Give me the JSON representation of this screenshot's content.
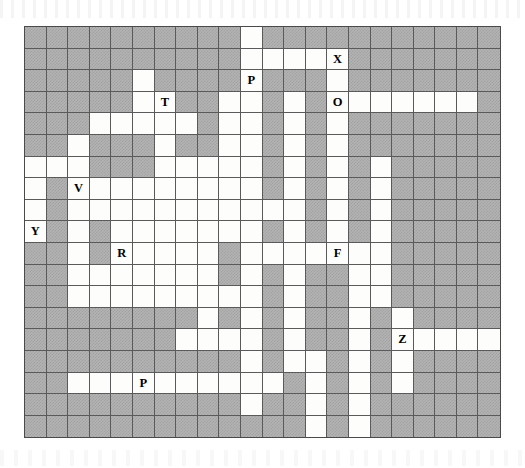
{
  "puzzle": {
    "type": "word-search-grid",
    "title": "",
    "columns": 22,
    "rows": 19,
    "cell_size_px": 21.6,
    "origin_px": {
      "x": 24,
      "y": 26
    },
    "colors": {
      "blocked_cell": "#b3b3b3",
      "open_cell": "#fdfdfb",
      "grid_line": "#5a5a5a",
      "border": "#4a4a4a",
      "letter": "#000000",
      "page_background": "#ffffff"
    },
    "legend": {
      "blocked": "shaded hatched square",
      "open": "white fillable square"
    },
    "letters": [
      {
        "row": 1,
        "col": 14,
        "char": "X"
      },
      {
        "row": 2,
        "col": 10,
        "char": "P"
      },
      {
        "row": 3,
        "col": 6,
        "char": "T"
      },
      {
        "row": 3,
        "col": 14,
        "char": "O"
      },
      {
        "row": 7,
        "col": 2,
        "char": "V"
      },
      {
        "row": 9,
        "col": 0,
        "char": "Y"
      },
      {
        "row": 10,
        "col": 4,
        "char": "R"
      },
      {
        "row": 10,
        "col": 14,
        "char": "F"
      },
      {
        "row": 14,
        "col": 17,
        "char": "Z"
      },
      {
        "row": 16,
        "col": 5,
        "char": "P"
      }
    ],
    "letters_flat": "X P T O V Y R F Z P",
    "open_cells": [
      [
        0,
        10
      ],
      [
        1,
        10
      ],
      [
        1,
        11
      ],
      [
        1,
        12
      ],
      [
        1,
        13
      ],
      [
        1,
        14
      ],
      [
        2,
        5
      ],
      [
        2,
        10
      ],
      [
        2,
        14
      ],
      [
        3,
        5
      ],
      [
        3,
        6
      ],
      [
        3,
        9
      ],
      [
        3,
        10
      ],
      [
        3,
        12
      ],
      [
        3,
        14
      ],
      [
        3,
        15
      ],
      [
        3,
        16
      ],
      [
        3,
        17
      ],
      [
        3,
        18
      ],
      [
        3,
        19
      ],
      [
        3,
        20
      ],
      [
        4,
        3
      ],
      [
        4,
        4
      ],
      [
        4,
        5
      ],
      [
        4,
        6
      ],
      [
        4,
        7
      ],
      [
        4,
        9
      ],
      [
        4,
        10
      ],
      [
        4,
        12
      ],
      [
        4,
        14
      ],
      [
        5,
        2
      ],
      [
        5,
        6
      ],
      [
        5,
        9
      ],
      [
        5,
        10
      ],
      [
        5,
        12
      ],
      [
        5,
        14
      ],
      [
        6,
        0
      ],
      [
        6,
        1
      ],
      [
        6,
        2
      ],
      [
        6,
        6
      ],
      [
        6,
        7
      ],
      [
        6,
        8
      ],
      [
        6,
        9
      ],
      [
        6,
        10
      ],
      [
        6,
        12
      ],
      [
        6,
        14
      ],
      [
        6,
        16
      ],
      [
        7,
        0
      ],
      [
        7,
        2
      ],
      [
        7,
        3
      ],
      [
        7,
        4
      ],
      [
        7,
        5
      ],
      [
        7,
        6
      ],
      [
        7,
        7
      ],
      [
        7,
        8
      ],
      [
        7,
        9
      ],
      [
        7,
        10
      ],
      [
        7,
        12
      ],
      [
        7,
        14
      ],
      [
        7,
        16
      ],
      [
        8,
        0
      ],
      [
        8,
        2
      ],
      [
        8,
        3
      ],
      [
        8,
        4
      ],
      [
        8,
        5
      ],
      [
        8,
        6
      ],
      [
        8,
        7
      ],
      [
        8,
        8
      ],
      [
        8,
        9
      ],
      [
        8,
        10
      ],
      [
        8,
        11
      ],
      [
        8,
        12
      ],
      [
        8,
        14
      ],
      [
        8,
        16
      ],
      [
        9,
        0
      ],
      [
        9,
        2
      ],
      [
        9,
        4
      ],
      [
        9,
        5
      ],
      [
        9,
        6
      ],
      [
        9,
        7
      ],
      [
        9,
        8
      ],
      [
        9,
        9
      ],
      [
        9,
        10
      ],
      [
        9,
        12
      ],
      [
        9,
        14
      ],
      [
        9,
        16
      ],
      [
        10,
        2
      ],
      [
        10,
        4
      ],
      [
        10,
        5
      ],
      [
        10,
        6
      ],
      [
        10,
        7
      ],
      [
        10,
        8
      ],
      [
        10,
        10
      ],
      [
        10,
        11
      ],
      [
        10,
        12
      ],
      [
        10,
        13
      ],
      [
        10,
        14
      ],
      [
        10,
        15
      ],
      [
        10,
        16
      ],
      [
        11,
        2
      ],
      [
        11,
        3
      ],
      [
        11,
        4
      ],
      [
        11,
        5
      ],
      [
        11,
        6
      ],
      [
        11,
        7
      ],
      [
        11,
        8
      ],
      [
        11,
        10
      ],
      [
        11,
        12
      ],
      [
        11,
        15
      ],
      [
        11,
        16
      ],
      [
        12,
        2
      ],
      [
        12,
        3
      ],
      [
        12,
        4
      ],
      [
        12,
        5
      ],
      [
        12,
        6
      ],
      [
        12,
        7
      ],
      [
        12,
        8
      ],
      [
        12,
        9
      ],
      [
        12,
        10
      ],
      [
        12,
        12
      ],
      [
        12,
        15
      ],
      [
        12,
        16
      ],
      [
        13,
        8
      ],
      [
        13,
        10
      ],
      [
        13,
        12
      ],
      [
        13,
        15
      ],
      [
        13,
        17
      ],
      [
        14,
        7
      ],
      [
        14,
        8
      ],
      [
        14,
        9
      ],
      [
        14,
        10
      ],
      [
        14,
        12
      ],
      [
        14,
        15
      ],
      [
        14,
        17
      ],
      [
        14,
        18
      ],
      [
        14,
        19
      ],
      [
        14,
        20
      ],
      [
        14,
        21
      ],
      [
        15,
        10
      ],
      [
        15,
        12
      ],
      [
        15,
        13
      ],
      [
        15,
        15
      ],
      [
        15,
        17
      ],
      [
        16,
        2
      ],
      [
        16,
        3
      ],
      [
        16,
        4
      ],
      [
        16,
        5
      ],
      [
        16,
        6
      ],
      [
        16,
        7
      ],
      [
        16,
        8
      ],
      [
        16,
        9
      ],
      [
        16,
        10
      ],
      [
        16,
        11
      ],
      [
        16,
        13
      ],
      [
        16,
        15
      ],
      [
        16,
        17
      ],
      [
        17,
        10
      ],
      [
        17,
        13
      ],
      [
        17,
        15
      ],
      [
        18,
        13
      ],
      [
        18,
        15
      ]
    ]
  }
}
